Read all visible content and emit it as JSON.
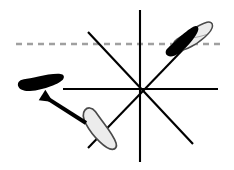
{
  "canvas": {
    "width": 234,
    "height": 170,
    "background_color": "#ffffff"
  },
  "diagram": {
    "colors": {
      "line": "#000000",
      "dashed_reference": "#a0a0a0",
      "filled_footprint": "#000000",
      "outline_footprint_fill": "#e8e8e8",
      "outline_footprint_stroke": "#555555",
      "arrow": "#000000"
    },
    "center": {
      "x": 140,
      "y": 89
    },
    "spokes": [
      {
        "name": "vertical-spoke",
        "x1": 140,
        "y1": 10,
        "x2": 140,
        "y2": 162
      },
      {
        "name": "horizontal-spoke",
        "x1": 63,
        "y1": 89,
        "x2": 218,
        "y2": 89
      },
      {
        "name": "diagonal-nw-se-spoke",
        "x1": 88,
        "y1": 32,
        "x2": 193,
        "y2": 144
      },
      {
        "name": "diagonal-ne-sw-spoke",
        "x1": 196,
        "y1": 36,
        "x2": 88,
        "y2": 148
      }
    ],
    "reference_line": {
      "name": "dashed-horizontal-reference",
      "x1": 16,
      "y1": 44,
      "x2": 222,
      "y2": 44,
      "dash": "6 5",
      "width": 2
    },
    "markers": [
      {
        "name": "filled-footprint-upper-right",
        "style": "filled",
        "x": 186,
        "y": 41,
        "rotation": -35,
        "scale": 1.0
      },
      {
        "name": "outline-footprint-upper-right",
        "style": "outline",
        "x": 194,
        "y": 38,
        "rotation": -28,
        "scale": 1.0
      },
      {
        "name": "filled-footprint-left",
        "style": "filled",
        "x": 42,
        "y": 83,
        "rotation": -8,
        "scale": 1.0
      },
      {
        "name": "outline-footprint-lower",
        "style": "outline",
        "x": 100,
        "y": 131,
        "rotation": 32,
        "scale": 1.0
      }
    ],
    "arrow": {
      "name": "movement-arrow",
      "from_x": 86,
      "from_y": 123,
      "to_x": 53,
      "to_y": 102,
      "width": 4
    }
  }
}
